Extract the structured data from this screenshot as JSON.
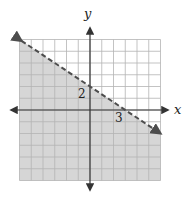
{
  "graph": {
    "title": "",
    "type": "linear-inequality",
    "axes": {
      "x_label": "x",
      "y_label": "y",
      "x_range": [
        -6,
        6
      ],
      "y_range": [
        -6,
        6
      ],
      "grid": true,
      "grid_step": 1
    },
    "boundary_line": {
      "equation": "y = -2/3 x + 2",
      "style": "dashed",
      "slope": -0.6667,
      "y_intercept": 2,
      "x_intercept": 3,
      "endpoints": [
        [
          -6,
          6
        ],
        [
          6,
          -2
        ]
      ]
    },
    "shaded_region": "below",
    "inequality": "y < -2/3 x + 2",
    "annotations": [
      {
        "text": "2",
        "at": [
          0,
          2
        ],
        "position": "left-below"
      },
      {
        "text": "3",
        "at": [
          3,
          0
        ],
        "position": "left-below"
      }
    ],
    "colors": {
      "shade": "#d6d6d6",
      "grid_shaded": "#9a9a9a",
      "grid_unshaded": "#b4b4b4",
      "axis": "#333333",
      "boundary": "#4d4d4d"
    }
  }
}
